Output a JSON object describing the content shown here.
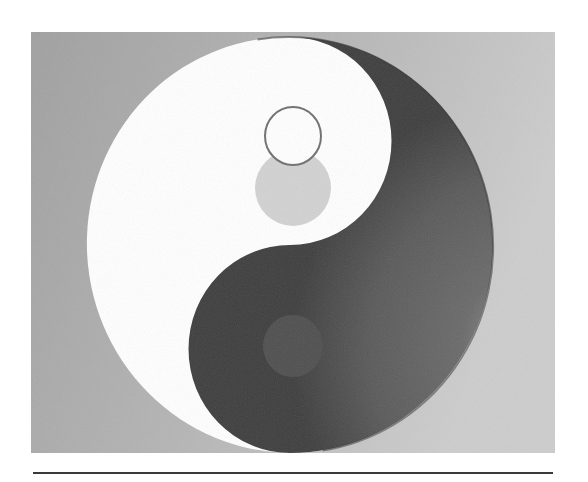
{
  "figure": {
    "colors": {
      "background_left": "#a2a2a2",
      "background_right": "#cbcbcb",
      "yin_dark": "#555555",
      "yin_halo": "#8a8a8a",
      "yang_light": "#ffffff",
      "rule": "#3a3a3a"
    }
  }
}
